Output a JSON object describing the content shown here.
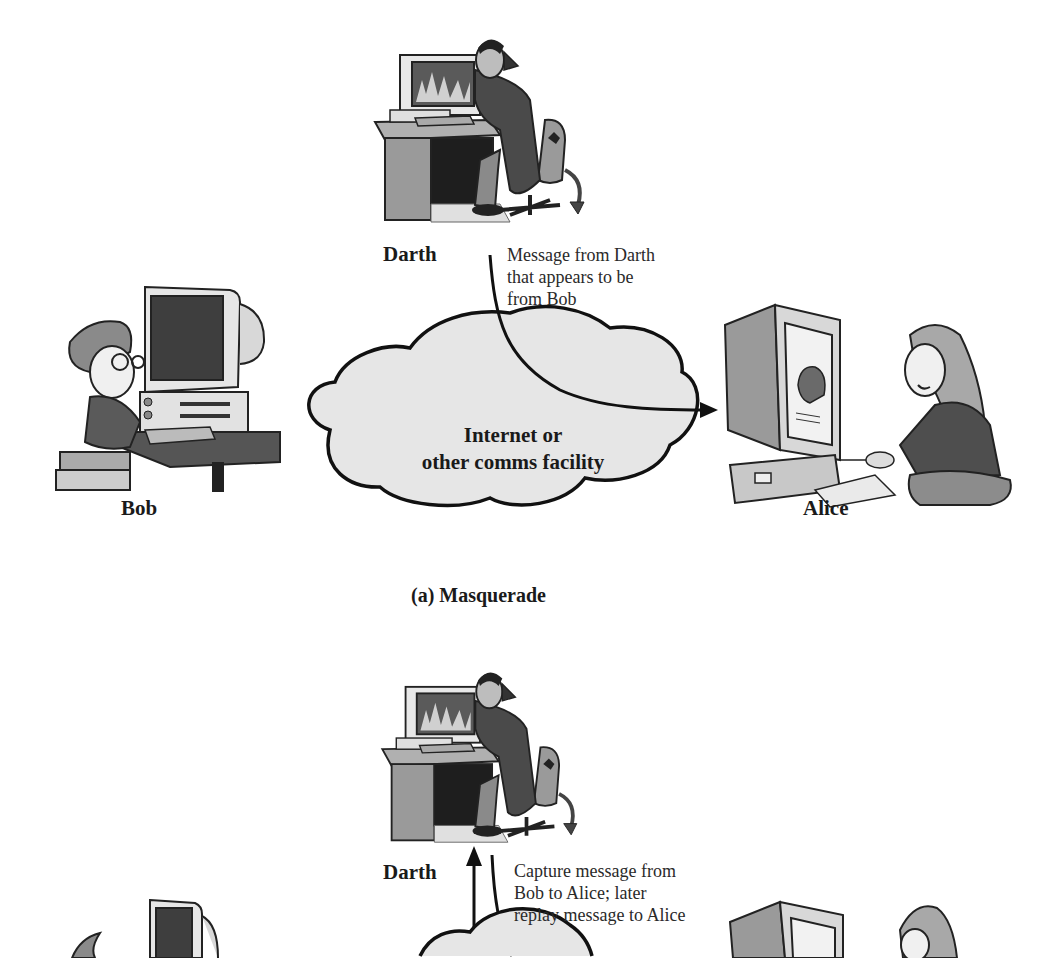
{
  "panels": [
    {
      "id": "a",
      "title": "(a) Masquerade",
      "actors": {
        "attacker": "Darth",
        "sender": "Bob",
        "receiver": "Alice"
      },
      "network_label_line1": "Internet or",
      "network_label_line2": "other comms facility",
      "annotation": [
        "Message from Darth",
        "that appears to be",
        "from Bob"
      ]
    },
    {
      "id": "b",
      "actors": {
        "attacker": "Darth"
      },
      "annotation": [
        "Capture message from",
        "Bob to Alice; later",
        "replay message to Alice"
      ]
    }
  ],
  "colors": {
    "line": "#111111",
    "cloud_fill": "#e6e6e6",
    "illustration_gray": "#9a9a9a",
    "illustration_dark": "#3a3a3a",
    "background": "#ffffff"
  }
}
